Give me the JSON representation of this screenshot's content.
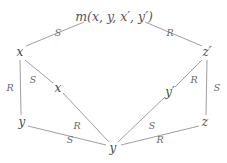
{
  "figure": {
    "type": "lattice-diagram",
    "background_color": "#ffffff",
    "line_color": "#8c8c8c",
    "text_color": "#4a4a4a",
    "width": 227,
    "height": 163
  },
  "nodes": [
    {
      "id": "root",
      "label": "m(x, y, x′, y′)",
      "x": 114,
      "y": 17
    },
    {
      "id": "x_top",
      "label": "x",
      "x": 20,
      "y": 52
    },
    {
      "id": "zp",
      "label": "z′",
      "x": 207,
      "y": 52
    },
    {
      "id": "x_mid",
      "label": "x",
      "x": 58,
      "y": 88
    },
    {
      "id": "yp",
      "label": "y′",
      "x": 170,
      "y": 92
    },
    {
      "id": "y_left",
      "label": "y",
      "x": 22,
      "y": 122
    },
    {
      "id": "z",
      "label": "z",
      "x": 205,
      "y": 122
    },
    {
      "id": "y_bot",
      "label": "y",
      "x": 113,
      "y": 148
    }
  ],
  "edges": [
    {
      "from": "x_top",
      "to": "root",
      "label": "S",
      "label_x": 58,
      "label_y": 33,
      "x1": 26,
      "y1": 46,
      "x2": 84,
      "y2": 22
    },
    {
      "from": "root",
      "to": "zp",
      "label": "R",
      "label_x": 170,
      "label_y": 33,
      "x1": 145,
      "y1": 22,
      "x2": 202,
      "y2": 46
    },
    {
      "from": "x_top",
      "to": "y_left",
      "label": "R",
      "label_x": 10,
      "label_y": 88,
      "x1": 20,
      "y1": 60,
      "x2": 21,
      "y2": 115
    },
    {
      "from": "x_top",
      "to": "x_mid",
      "label": "S",
      "label_x": 33,
      "label_y": 80,
      "x1": 25,
      "y1": 60,
      "x2": 53,
      "y2": 83
    },
    {
      "from": "zp",
      "to": "z",
      "label": "S",
      "label_x": 217,
      "label_y": 88,
      "x1": 207,
      "y1": 60,
      "x2": 206,
      "y2": 115
    },
    {
      "from": "zp",
      "to": "yp",
      "label": "R",
      "label_x": 194,
      "label_y": 80,
      "x1": 202,
      "y1": 60,
      "x2": 175,
      "y2": 87
    },
    {
      "from": "x_mid",
      "to": "y_bot",
      "label": "R",
      "label_x": 77,
      "label_y": 126,
      "x1": 63,
      "y1": 93,
      "x2": 109,
      "y2": 142
    },
    {
      "from": "yp",
      "to": "y_bot",
      "label": "S",
      "label_x": 152,
      "label_y": 126,
      "x1": 165,
      "y1": 97,
      "x2": 118,
      "y2": 142
    },
    {
      "from": "y_left",
      "to": "y_bot",
      "label": "S",
      "label_x": 70,
      "label_y": 140,
      "x1": 28,
      "y1": 126,
      "x2": 106,
      "y2": 145
    },
    {
      "from": "z",
      "to": "y_bot",
      "label": "R",
      "label_x": 160,
      "label_y": 140,
      "x1": 199,
      "y1": 126,
      "x2": 121,
      "y2": 145
    }
  ]
}
